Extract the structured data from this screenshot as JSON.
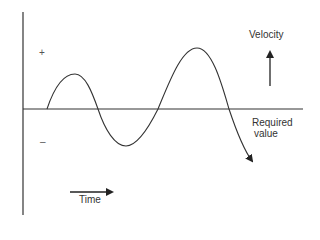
{
  "diagram": {
    "y_axis_label": "Velocity",
    "x_axis_label": "Time",
    "reference_line_label_line1": "Required",
    "reference_line_label_line2": "value",
    "positive_sign": "+",
    "negative_sign": "–",
    "curve_description": "Oscillating velocity around required value, with increasing amplitude, ending in a downward arrow"
  }
}
